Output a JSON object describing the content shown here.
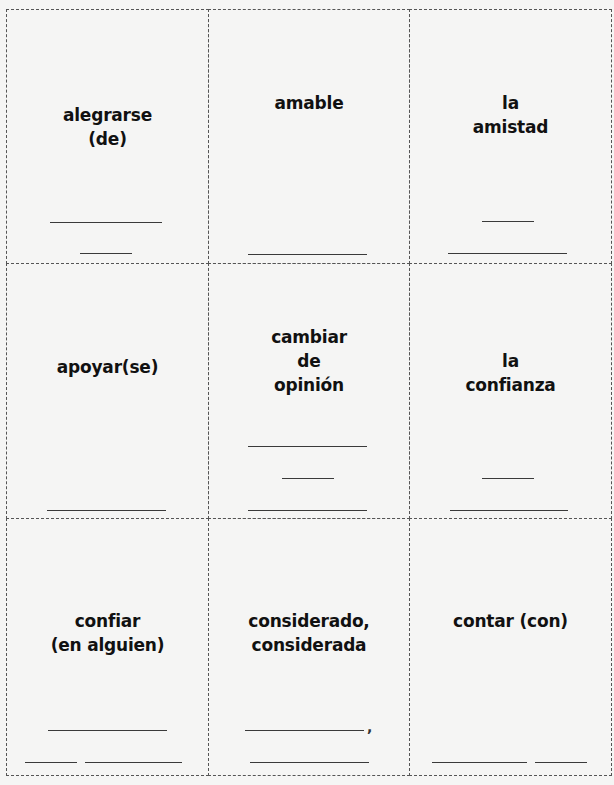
{
  "cards": [
    {
      "term": "alegrarse\n(de)",
      "row": 0,
      "col": 0,
      "term_top": 102,
      "blanks": [
        {
          "x": 50,
          "y": 222,
          "w": 112
        },
        {
          "x": 80,
          "y": 253,
          "w": 52
        }
      ]
    },
    {
      "term": "amable",
      "row": 0,
      "col": 1,
      "term_top": 90,
      "blanks": [
        {
          "x": 248,
          "y": 254,
          "w": 119
        }
      ]
    },
    {
      "term": "la\namistad",
      "row": 0,
      "col": 2,
      "term_top": 90,
      "blanks": [
        {
          "x": 482,
          "y": 221,
          "w": 52
        },
        {
          "x": 448,
          "y": 253,
          "w": 119
        }
      ]
    },
    {
      "term": "apoyar(se)",
      "row": 1,
      "col": 0,
      "term_top": 354,
      "blanks": [
        {
          "x": 47,
          "y": 510,
          "w": 119
        }
      ]
    },
    {
      "term": "cambiar\nde\nopinión",
      "row": 1,
      "col": 1,
      "term_top": 324,
      "blanks": [
        {
          "x": 248,
          "y": 446,
          "w": 119
        },
        {
          "x": 282,
          "y": 478,
          "w": 52
        },
        {
          "x": 248,
          "y": 510,
          "w": 119
        }
      ]
    },
    {
      "term": "la\nconfianza",
      "row": 1,
      "col": 2,
      "term_top": 348,
      "blanks": [
        {
          "x": 482,
          "y": 478,
          "w": 52
        },
        {
          "x": 450,
          "y": 510,
          "w": 118
        }
      ]
    },
    {
      "term": "confiar\n(en alguien)",
      "row": 2,
      "col": 0,
      "term_top": 608,
      "blanks": [
        {
          "x": 48,
          "y": 730,
          "w": 119
        },
        {
          "x": 25,
          "y": 762,
          "w": 52
        },
        {
          "x": 85,
          "y": 762,
          "w": 97
        }
      ]
    },
    {
      "term": "considerado,\nconsiderada",
      "row": 2,
      "col": 1,
      "term_top": 608,
      "blanks": [
        {
          "x": 245,
          "y": 730,
          "w": 119,
          "trailing": ","
        },
        {
          "x": 250,
          "y": 762,
          "w": 119
        }
      ]
    },
    {
      "term": "contar (con)",
      "row": 2,
      "col": 2,
      "term_top": 608,
      "blanks": [
        {
          "x": 432,
          "y": 762,
          "w": 95
        },
        {
          "x": 535,
          "y": 762,
          "w": 52
        }
      ]
    }
  ]
}
